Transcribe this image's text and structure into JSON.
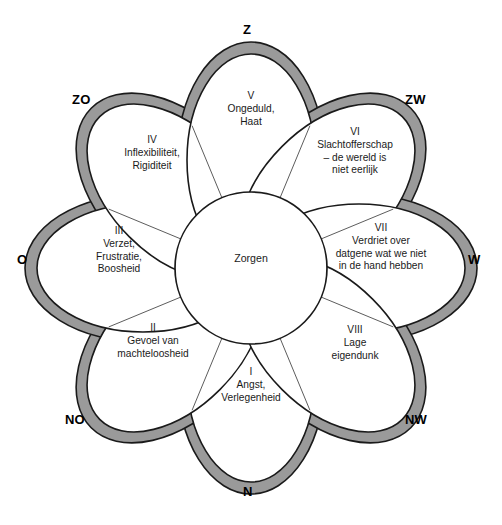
{
  "diagram": {
    "type": "radial-petal-wheel",
    "center": {
      "label": "Zorgen"
    },
    "petals": [
      {
        "roman": "I",
        "body": "Angst,\nVerlegenheid",
        "position": "bottom"
      },
      {
        "roman": "II",
        "body": "Gevoel van\nmachteloosheid",
        "position": "bottom-left"
      },
      {
        "roman": "III",
        "body": "Verzet,\nFrustratie,\nBoosheid",
        "position": "left"
      },
      {
        "roman": "IV",
        "body": "Inflexibiliteit,\nRigiditeit",
        "position": "top-left"
      },
      {
        "roman": "V",
        "body": "Ongeduld,\nHaat",
        "position": "top"
      },
      {
        "roman": "VI",
        "body": "Slachtofferschap\n– de wereld is\nniet eerlijk",
        "position": "top-right"
      },
      {
        "roman": "VII",
        "body": "Verdriet over\ndatgene wat we niet\nin de hand hebben",
        "position": "right"
      },
      {
        "roman": "VIII",
        "body": "Lage\neigendunk",
        "position": "bottom-right"
      }
    ],
    "compass": [
      {
        "label": "Z",
        "position": "top"
      },
      {
        "label": "ZO",
        "position": "top-left"
      },
      {
        "label": "ZW",
        "position": "top-right"
      },
      {
        "label": "O",
        "position": "left"
      },
      {
        "label": "W",
        "position": "right"
      },
      {
        "label": "NO",
        "position": "bottom-left"
      },
      {
        "label": "NW",
        "position": "bottom-right"
      },
      {
        "label": "N",
        "position": "bottom"
      }
    ],
    "colors": {
      "band": "#9a9a9a",
      "inner": "#ffffff",
      "stroke": "#1a1a1a",
      "text": "#1a1a1a"
    }
  }
}
